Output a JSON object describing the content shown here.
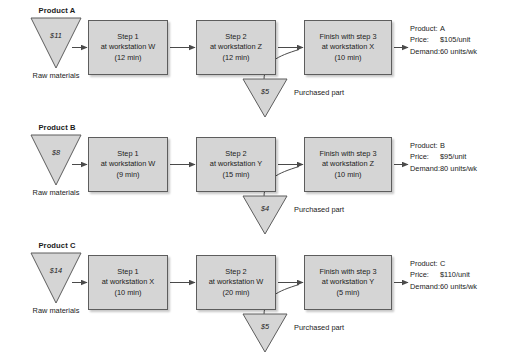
{
  "diagram": {
    "box_fill": "#d5d5d5",
    "box_stroke": "#5d5d5d",
    "line_color": "#4a4a4a",
    "raw_caption": "Raw materials",
    "purchased_caption": "Purchased part",
    "info_keys": {
      "product": "Product:",
      "price": "Price:",
      "demand": "Demand:"
    }
  },
  "rows": [
    {
      "product_label": "Product A",
      "raw_cost": "$11",
      "raw_caption": "Raw materials",
      "steps": [
        {
          "title": "Step 1",
          "station": "at workstation W",
          "time": "(12 min)"
        },
        {
          "title": "Step 2",
          "station": "at workstation Z",
          "time": "(12 min)"
        },
        {
          "title": "Finish with step 3",
          "station": "at workstation X",
          "time": "(10 min)"
        }
      ],
      "purchased_cost": "$5",
      "purchased_caption": "Purchased part",
      "info": {
        "product": "A",
        "price": "$105/unit",
        "demand": "60 units/wk"
      }
    },
    {
      "product_label": "Product B",
      "raw_cost": "$8",
      "raw_caption": "Raw materials",
      "steps": [
        {
          "title": "Step 1",
          "station": "at workstation W",
          "time": "(9 min)"
        },
        {
          "title": "Step 2",
          "station": "at workstation Y",
          "time": "(15 min)"
        },
        {
          "title": "Finish with step 3",
          "station": "at workstation Z",
          "time": "(10 min)"
        }
      ],
      "purchased_cost": "$4",
      "purchased_caption": "Purchased part",
      "info": {
        "product": "B",
        "price": "$95/unit",
        "demand": "80 units/wk"
      }
    },
    {
      "product_label": "Product C",
      "raw_cost": "$14",
      "raw_caption": "Raw materials",
      "steps": [
        {
          "title": "Step 1",
          "station": "at workstation X",
          "time": "(10 min)"
        },
        {
          "title": "Step 2",
          "station": "at workstation W",
          "time": "(20 min)"
        },
        {
          "title": "Finish with step 3",
          "station": "at workstation Y",
          "time": "(5 min)"
        }
      ],
      "purchased_cost": "$5",
      "purchased_caption": "Purchased part",
      "info": {
        "product": "C",
        "price": "$110/unit",
        "demand": "60 units/wk"
      }
    }
  ]
}
